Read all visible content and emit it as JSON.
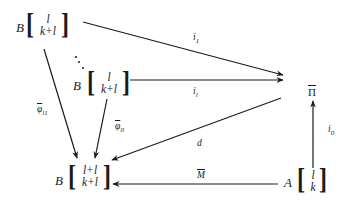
{
  "diagram": {
    "nodes": {
      "top_left": {
        "prefix": "B",
        "top": "l",
        "bottom": "k+l"
      },
      "middle_left": {
        "prefix": "B",
        "top": "l",
        "bottom": "k+l"
      },
      "bottom_left": {
        "prefix": "B",
        "top": "l+l",
        "bottom": "k+l"
      },
      "bottom_right": {
        "prefix": "A",
        "top": "l",
        "bottom": "k"
      },
      "right": {
        "label": "Π"
      }
    },
    "edges": {
      "i1": {
        "label": "i",
        "sub": "1",
        "from": "top_left",
        "to": "right"
      },
      "il": {
        "label": "i",
        "sub": "l",
        "from": "middle_left",
        "to": "right"
      },
      "phi_l1": {
        "label": "φ",
        "sub": "l1",
        "from": "top_left",
        "to": "bottom_left",
        "overbar": true
      },
      "phi_ll": {
        "label": "φ",
        "sub": "ll",
        "from": "middle_left",
        "to": "bottom_left",
        "overbar": true
      },
      "d": {
        "label": "d",
        "from": "right",
        "to": "bottom_left"
      },
      "M": {
        "label": "M",
        "from": "bottom_right",
        "to": "bottom_left",
        "overbar": true
      },
      "i0": {
        "label": "i",
        "sub": "0",
        "from": "bottom_right",
        "to": "right"
      }
    },
    "colors": {
      "ink": "#1a1a1a",
      "background": "#ffffff"
    }
  }
}
